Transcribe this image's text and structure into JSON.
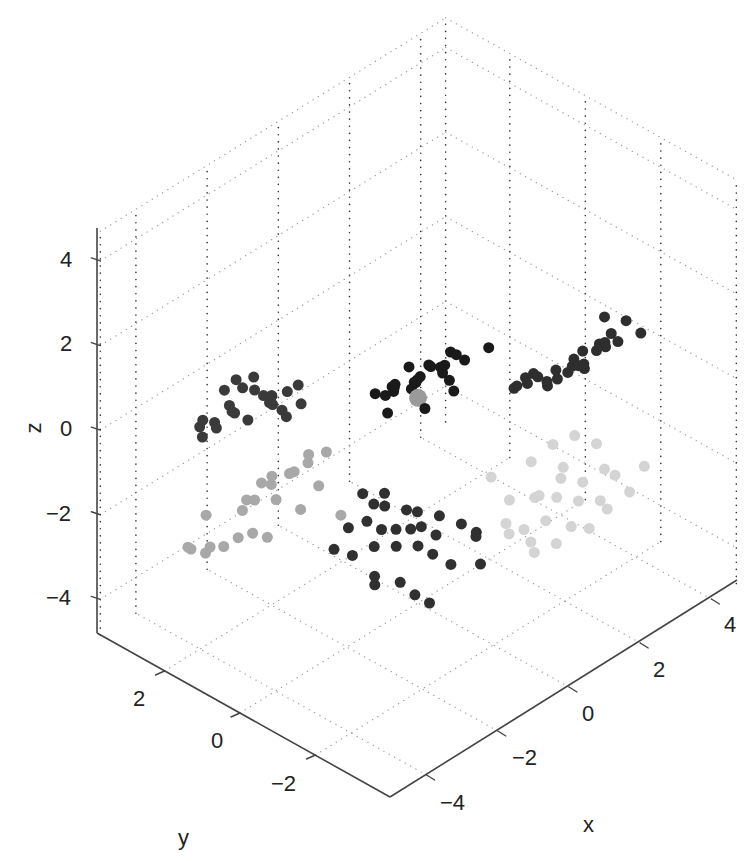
{
  "chart_data": {
    "type": "scatter3d",
    "title": "",
    "xlabel": "x",
    "ylabel": "y",
    "zlabel": "z",
    "xlim": [
      -5,
      4.7
    ],
    "ylim": [
      -4,
      3.7
    ],
    "zlim": [
      -4.85,
      4.7
    ],
    "x_ticks": [
      -4,
      -2,
      0,
      2,
      4
    ],
    "y_ticks": [
      2,
      0,
      -2
    ],
    "z_ticks": [
      4,
      2,
      0,
      -2,
      -4
    ],
    "x_tick_labels": [
      "−4",
      "−2",
      "0",
      "2",
      "4"
    ],
    "y_tick_labels": [
      "2",
      "0",
      "−2"
    ],
    "z_tick_labels": [
      "4",
      "2",
      "0",
      "−2",
      "−4"
    ],
    "grid": true,
    "legend": null,
    "series": [
      {
        "name": "center",
        "color": "#9a9a9a",
        "size": 9,
        "points": [
          [
            0,
            0,
            0
          ]
        ]
      },
      {
        "name": "cluster-top",
        "color": "#1a1a1a",
        "size": 5.5,
        "points": [
          [
            -3.2,
            -3.2,
            3.0
          ],
          [
            -2.6,
            -3.4,
            3.2
          ],
          [
            -2.3,
            -3.0,
            3.1
          ],
          [
            -2.8,
            -2.7,
            3.3
          ],
          [
            -2.0,
            -2.9,
            3.5
          ],
          [
            -3.4,
            -2.4,
            2.6
          ],
          [
            -3.0,
            -2.2,
            2.9
          ],
          [
            -2.5,
            -2.3,
            2.8
          ],
          [
            -1.9,
            -2.5,
            3.0
          ],
          [
            -1.3,
            -3.1,
            3.4
          ],
          [
            -2.7,
            -1.9,
            2.5
          ],
          [
            -2.2,
            -1.9,
            2.3
          ],
          [
            -1.8,
            -1.6,
            2.1
          ],
          [
            -1.5,
            -1.7,
            2.4
          ],
          [
            -1.1,
            -1.9,
            2.6
          ],
          [
            -2.4,
            -1.4,
            2.0
          ],
          [
            -2.0,
            -1.2,
            1.9
          ],
          [
            -1.4,
            -1.3,
            1.8
          ],
          [
            -0.9,
            -1.5,
            1.8
          ],
          [
            -0.6,
            -1.8,
            2.1
          ],
          [
            -1.6,
            -0.9,
            1.6
          ],
          [
            -1.1,
            -0.8,
            1.7
          ],
          [
            -0.7,
            -1.0,
            1.6
          ],
          [
            -2.9,
            -1.6,
            2.4
          ],
          [
            -1.7,
            -2.2,
            2.7
          ]
        ]
      },
      {
        "name": "cluster-left-upper",
        "color": "#3a3a3a",
        "size": 5.5,
        "points": [
          [
            -3.6,
            1.6,
            0.9
          ],
          [
            -3.2,
            1.8,
            1.2
          ],
          [
            -3.0,
            1.5,
            1.0
          ],
          [
            -2.9,
            1.2,
            0.8
          ],
          [
            -3.4,
            1.3,
            0.6
          ],
          [
            -2.6,
            1.4,
            0.5
          ],
          [
            -3.8,
            2.2,
            0.2
          ],
          [
            -3.5,
            2.4,
            0.1
          ],
          [
            -3.1,
            2.0,
            0.3
          ],
          [
            -2.7,
            2.1,
            0.6
          ],
          [
            -2.3,
            1.7,
            0.4
          ],
          [
            -2.1,
            1.9,
            0.2
          ],
          [
            -2.5,
            2.5,
            -0.3
          ],
          [
            -2.0,
            1.6,
            -0.2
          ],
          [
            -1.8,
            1.4,
            0.1
          ],
          [
            -3.3,
            2.6,
            -0.5
          ],
          [
            -2.8,
            2.7,
            -0.6
          ],
          [
            -1.7,
            2.0,
            -0.4
          ],
          [
            -2.4,
            1.2,
            0.8
          ],
          [
            -2.2,
            1.1,
            0.9
          ],
          [
            -3.0,
            2.3,
            0.6
          ],
          [
            -1.9,
            2.3,
            -0.1
          ],
          [
            -2.6,
            1.9,
            0.9
          ],
          [
            -3.7,
            1.9,
            0.4
          ]
        ]
      },
      {
        "name": "cluster-right-upper",
        "color": "#2e2e2e",
        "size": 5.5,
        "points": [
          [
            1.6,
            -2.9,
            1.3
          ],
          [
            1.9,
            -2.6,
            1.1
          ],
          [
            2.3,
            -2.8,
            1.4
          ],
          [
            2.6,
            -2.5,
            1.2
          ],
          [
            2.8,
            -2.3,
            1.6
          ],
          [
            1.2,
            -2.3,
            0.8
          ],
          [
            1.5,
            -2.0,
            0.6
          ],
          [
            1.9,
            -1.9,
            0.4
          ],
          [
            2.3,
            -1.8,
            0.3
          ],
          [
            2.7,
            -1.7,
            0.2
          ],
          [
            3.0,
            -1.9,
            0.5
          ],
          [
            3.2,
            -2.1,
            0.9
          ],
          [
            3.3,
            -2.4,
            1.3
          ],
          [
            0.9,
            -2.0,
            1.0
          ],
          [
            1.0,
            -1.6,
            0.5
          ],
          [
            1.4,
            -1.3,
            0.2
          ],
          [
            1.8,
            -1.2,
            0.0
          ],
          [
            2.2,
            -1.1,
            -0.1
          ],
          [
            2.6,
            -1.2,
            -0.1
          ],
          [
            3.0,
            -1.3,
            0.0
          ],
          [
            3.4,
            -1.6,
            0.3
          ],
          [
            3.6,
            -1.9,
            0.4
          ],
          [
            2.0,
            -2.2,
            0.8
          ],
          [
            2.4,
            -2.1,
            0.9
          ],
          [
            0.7,
            -2.4,
            1.4
          ],
          [
            3.5,
            -2.6,
            1.0
          ]
        ]
      },
      {
        "name": "cluster-left-lower",
        "color": "#a8a8a8",
        "size": 5.5,
        "points": [
          [
            -3.0,
            1.5,
            -1.6
          ],
          [
            -2.7,
            1.6,
            -1.4
          ],
          [
            -2.5,
            1.4,
            -1.8
          ],
          [
            -2.3,
            1.7,
            -1.5
          ],
          [
            -2.8,
            1.9,
            -1.9
          ],
          [
            -2.1,
            1.3,
            -1.3
          ],
          [
            -3.3,
            2.5,
            -2.3
          ],
          [
            -2.6,
            2.2,
            -2.4
          ],
          [
            -2.0,
            2.0,
            -2.0
          ],
          [
            -1.7,
            1.8,
            -1.8
          ],
          [
            -1.5,
            1.5,
            -1.5
          ],
          [
            -1.3,
            1.2,
            -1.2
          ],
          [
            -1.8,
            1.2,
            -1.0
          ],
          [
            -3.6,
            2.7,
            -3.0
          ],
          [
            -3.3,
            2.9,
            -3.3
          ],
          [
            -3.0,
            2.8,
            -3.5
          ],
          [
            -2.7,
            2.6,
            -3.4
          ],
          [
            -2.4,
            2.5,
            -3.3
          ],
          [
            -2.1,
            2.4,
            -3.3
          ],
          [
            -1.9,
            2.2,
            -3.4
          ],
          [
            -3.4,
            2.3,
            -2.9
          ],
          [
            -1.6,
            1.6,
            -2.6
          ],
          [
            -1.2,
            1.5,
            -2.2
          ],
          [
            -1.0,
            1.1,
            -2.8
          ]
        ]
      },
      {
        "name": "cluster-right-lower",
        "color": "#d4d4d4",
        "size": 5.5,
        "points": [
          [
            1.8,
            -1.3,
            -1.8
          ],
          [
            2.2,
            -1.5,
            -1.5
          ],
          [
            2.6,
            -1.7,
            -1.4
          ],
          [
            3.0,
            -1.9,
            -1.7
          ],
          [
            1.6,
            -1.7,
            -2.3
          ],
          [
            2.0,
            -1.9,
            -2.0
          ],
          [
            2.4,
            -2.1,
            -2.2
          ],
          [
            2.8,
            -2.3,
            -2.0
          ],
          [
            3.2,
            -2.2,
            -2.4
          ],
          [
            1.4,
            -1.1,
            -2.6
          ],
          [
            1.8,
            -1.4,
            -2.6
          ],
          [
            2.2,
            -1.6,
            -2.7
          ],
          [
            2.6,
            -1.8,
            -2.9
          ],
          [
            3.0,
            -2.0,
            -3.0
          ],
          [
            3.4,
            -2.4,
            -2.8
          ],
          [
            1.2,
            -1.2,
            -3.0
          ],
          [
            1.6,
            -1.3,
            -3.3
          ],
          [
            2.0,
            -1.5,
            -3.2
          ],
          [
            2.5,
            -1.7,
            -3.5
          ],
          [
            2.9,
            -1.8,
            -3.7
          ],
          [
            1.5,
            -1.0,
            -3.5
          ],
          [
            1.9,
            -1.2,
            -3.8
          ],
          [
            2.4,
            -1.4,
            -4.0
          ],
          [
            3.3,
            -1.9,
            -3.4
          ],
          [
            2.1,
            -1.1,
            -4.2
          ],
          [
            3.6,
            -2.6,
            -2.2
          ],
          [
            1.1,
            -0.9,
            -2.0
          ],
          [
            2.7,
            -1.3,
            -2.4
          ]
        ]
      },
      {
        "name": "cluster-bottom",
        "color": "#303030",
        "size": 5.5,
        "points": [
          [
            -0.6,
            0.9,
            -2.4
          ],
          [
            -0.2,
            0.7,
            -2.5
          ],
          [
            -0.5,
            0.7,
            -2.6
          ],
          [
            -0.8,
            0.6,
            -2.8
          ],
          [
            0.1,
            0.4,
            -2.9
          ],
          [
            -1.0,
            0.9,
            -3.0
          ],
          [
            -0.6,
            0.4,
            -3.0
          ],
          [
            -0.3,
            0.3,
            -3.1
          ],
          [
            -0.1,
            0.1,
            -3.1
          ],
          [
            0.2,
            0.1,
            -3.2
          ],
          [
            0.3,
            0.3,
            -3.0
          ],
          [
            -1.3,
            1.0,
            -3.4
          ],
          [
            -1.1,
            0.7,
            -3.5
          ],
          [
            -0.7,
            0.5,
            -3.4
          ],
          [
            -0.4,
            0.2,
            -3.4
          ],
          [
            0.0,
            0.0,
            -3.5
          ],
          [
            0.4,
            -0.1,
            -3.4
          ],
          [
            0.6,
            0.0,
            -3.1
          ],
          [
            0.9,
            -0.3,
            -3.3
          ],
          [
            1.0,
            -0.6,
            -3.4
          ],
          [
            1.1,
            -0.5,
            -3.6
          ],
          [
            -0.9,
            0.3,
            -3.9
          ],
          [
            -1.0,
            0.2,
            -4.0
          ],
          [
            -0.5,
            0.0,
            -4.1
          ],
          [
            0.5,
            -0.4,
            -4.0
          ],
          [
            0.8,
            -0.9,
            -3.9
          ],
          [
            -0.3,
            -0.2,
            -4.4
          ],
          [
            -0.1,
            -0.4,
            -4.6
          ],
          [
            -0.3,
            0.6,
            -2.7
          ],
          [
            0.2,
            -0.2,
            -3.7
          ]
        ]
      }
    ]
  },
  "axes": {
    "x": {
      "label": "x",
      "ticks": [
        "−4",
        "−2",
        "0",
        "2",
        "4"
      ]
    },
    "y": {
      "label": "y",
      "ticks": [
        "2",
        "0",
        "−2"
      ]
    },
    "z": {
      "label": "z",
      "ticks": [
        "4",
        "2",
        "0",
        "−2",
        "−4"
      ]
    }
  },
  "colors": {
    "axis": "#444444",
    "grid": "#9a9a9a",
    "z_grid": "#333333",
    "text": "#222222",
    "background": "#ffffff"
  }
}
